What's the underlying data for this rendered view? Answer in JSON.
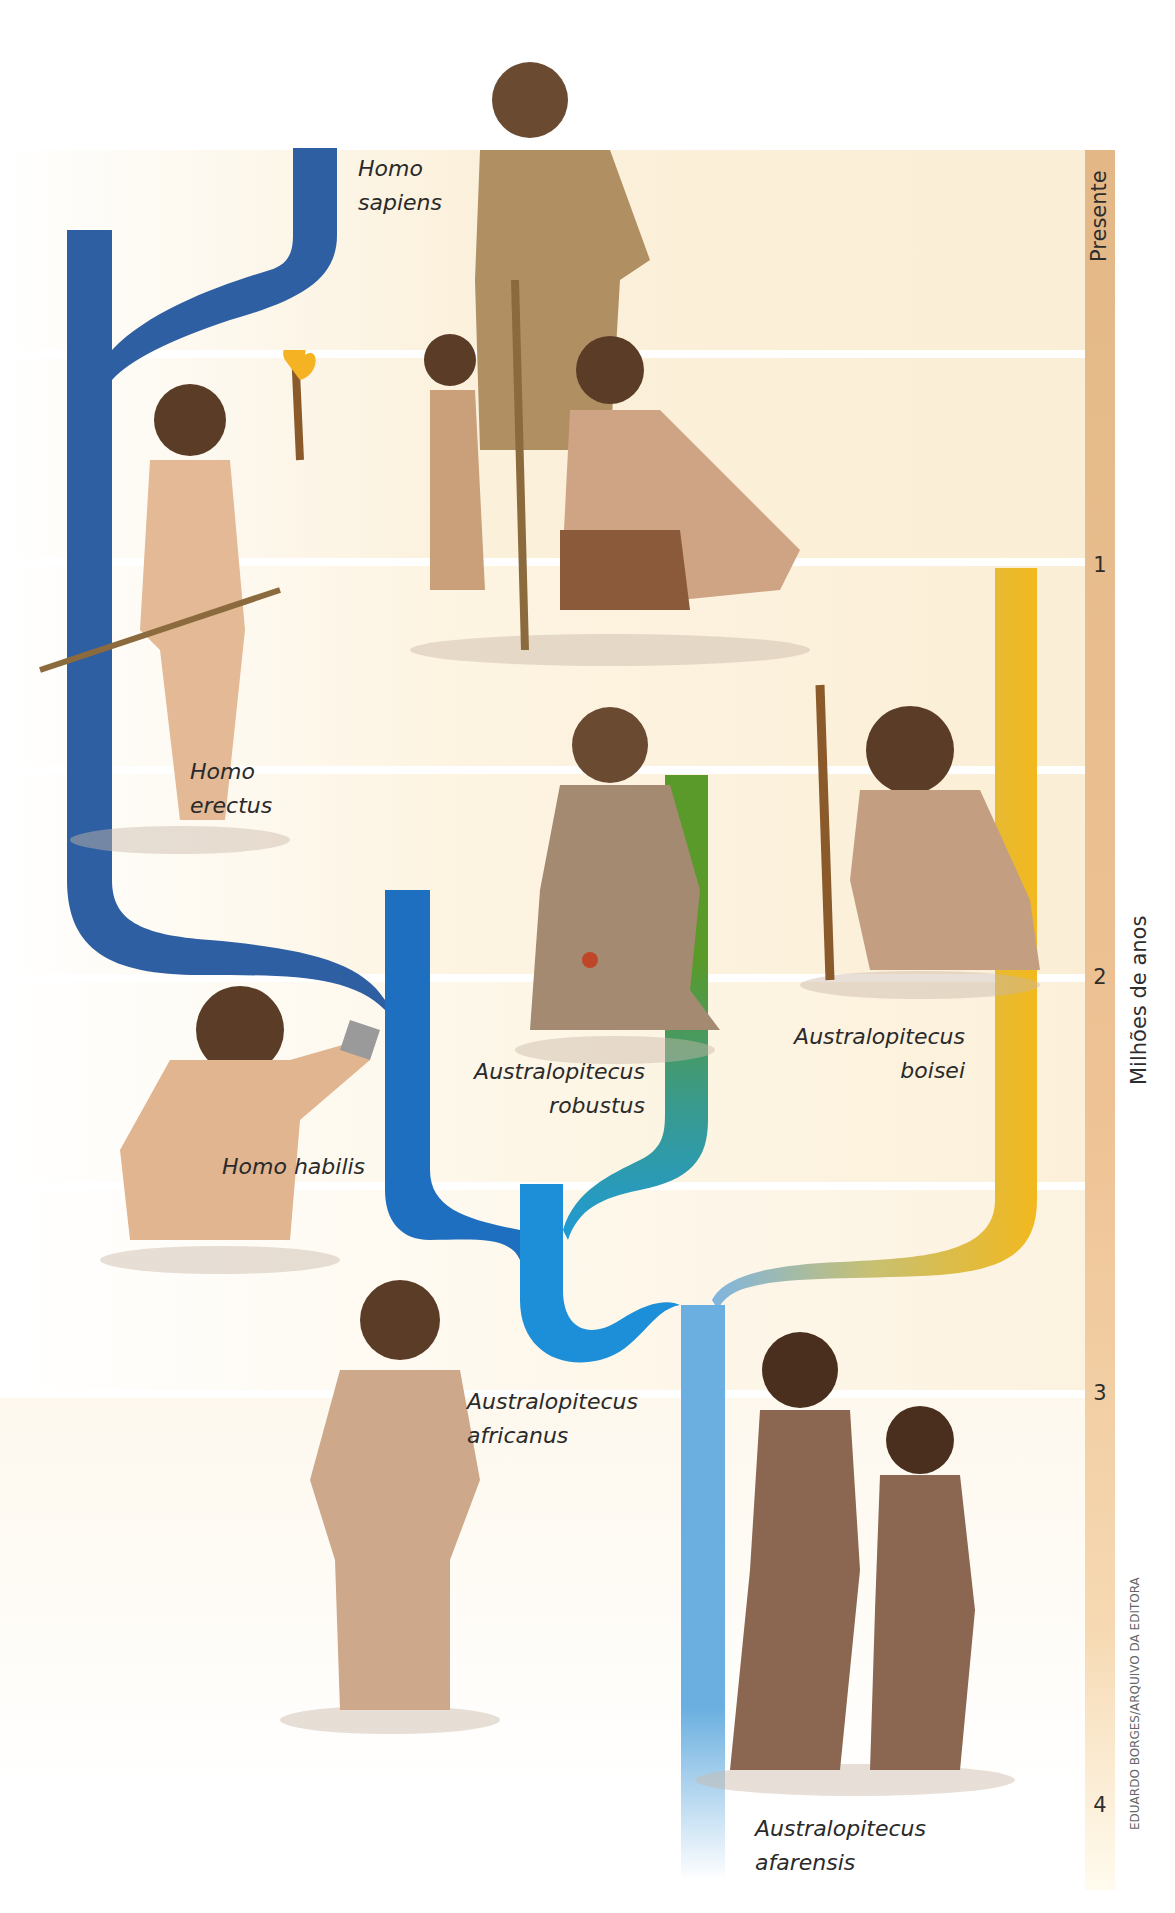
{
  "diagram": {
    "time_axis": {
      "label": "Milhões de anos",
      "ticks": [
        {
          "label": "Presente",
          "y": 150
        },
        {
          "label": "1",
          "y": 568
        },
        {
          "label": "2",
          "y": 980
        },
        {
          "label": "3",
          "y": 1396
        },
        {
          "label": "4",
          "y": 1808
        }
      ],
      "color": "#e9bd8b"
    },
    "credit": "EDUARDO BORGES/ARQUIVO DA EDITORA",
    "background_band_color": "#fcf1dc",
    "species": [
      {
        "id": "homo-sapiens",
        "name_line1": "Homo",
        "name_line2": "sapiens",
        "color": "#2f5fa3",
        "figure": "Group of three Homo sapiens with spear"
      },
      {
        "id": "homo-erectus",
        "name_line1": "Homo",
        "name_line2": "erectus",
        "color": "#2f5fa3",
        "figure": "Homo erectus holding torch and spear"
      },
      {
        "id": "homo-habilis",
        "name_line1": "Homo habilis",
        "name_line2": "",
        "color": "#1f6fc0",
        "figure": "Crouching Homo habilis holding stone tool"
      },
      {
        "id": "australopitecus-robustus",
        "name_line1": "Australopitecus",
        "name_line2": "robustus",
        "color": "#5a9a2a",
        "figure": "Kneeling Australopitecus robustus"
      },
      {
        "id": "australopitecus-boisei",
        "name_line1": "Australopitecus",
        "name_line2": "boisei",
        "color": "#f2b81e",
        "figure": "Crouching Australopitecus boisei with stick"
      },
      {
        "id": "australopitecus-africanus",
        "name_line1": "Australopitecus",
        "name_line2": "africanus",
        "color": "#1c8fd8",
        "figure": "Standing Australopitecus africanus"
      },
      {
        "id": "australopitecus-afarensis",
        "name_line1": "Australopitecus",
        "name_line2": "afarensis",
        "color": "#6aafe0",
        "figure": "Pair of walking Australopitecus afarensis"
      }
    ]
  }
}
